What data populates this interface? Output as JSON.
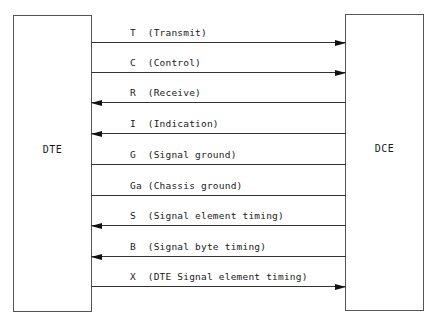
{
  "diagram": {
    "left_box": {
      "label": "DTE"
    },
    "right_box": {
      "label": "DCE"
    },
    "signals": [
      {
        "code": "T",
        "name": "Transmit",
        "text": "T  (Transmit)",
        "direction": "to-DCE",
        "line_y": 43
      },
      {
        "code": "C",
        "name": "Control",
        "text": "C  (Control)",
        "direction": "to-DCE",
        "line_y": 73
      },
      {
        "code": "R",
        "name": "Receive",
        "text": "R  (Receive)",
        "direction": "to-DTE",
        "line_y": 103
      },
      {
        "code": "I",
        "name": "Indication",
        "text": "I  (Indication)",
        "direction": "to-DTE",
        "line_y": 134
      },
      {
        "code": "G",
        "name": "Signal ground",
        "text": "G  (Signal ground)",
        "direction": "none",
        "line_y": 165
      },
      {
        "code": "Ga",
        "name": "Chassis ground",
        "text": "Ga (Chassis ground)",
        "direction": "none",
        "line_y": 196
      },
      {
        "code": "S",
        "name": "Signal element timing",
        "text": "S  (Signal element timing)",
        "direction": "to-DTE",
        "line_y": 226
      },
      {
        "code": "B",
        "name": "Signal byte timing",
        "text": "B  (Signal byte timing)",
        "direction": "to-DTE",
        "line_y": 257
      },
      {
        "code": "X",
        "name": "DTE Signal element timing",
        "text": "X  (DTE Signal element timing)",
        "direction": "to-DCE",
        "line_y": 287
      }
    ]
  }
}
